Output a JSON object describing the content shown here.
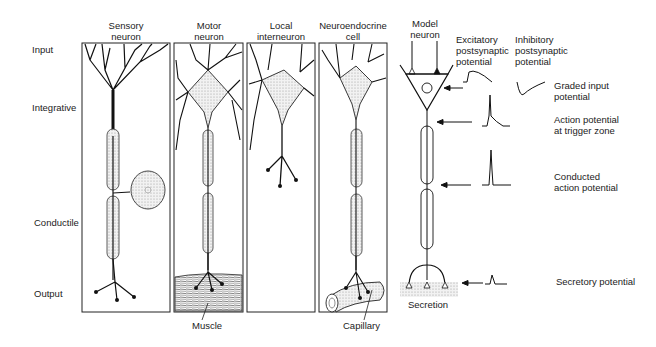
{
  "row_labels": {
    "input": "Input",
    "integrative": "Integrative",
    "conductile": "Conductile",
    "output": "Output"
  },
  "neuron_types": [
    {
      "title_line1": "Sensory",
      "title_line2": "neuron"
    },
    {
      "title_line1": "Motor",
      "title_line2": "neuron"
    },
    {
      "title_line1": "Local",
      "title_line2": "interneuron"
    },
    {
      "title_line1": "Neuroendocrine",
      "title_line2": "cell"
    }
  ],
  "bottom_labels": {
    "muscle": "Muscle",
    "capillary": "Capillary",
    "secretion": "Secretion"
  },
  "model": {
    "title_line1": "Model",
    "title_line2": "neuron",
    "excitatory_line1": "Excitatory",
    "excitatory_line2": "postsynaptic",
    "excitatory_line3": "potential",
    "inhibitory_line1": "Inhibitory",
    "inhibitory_line2": "postsynaptic",
    "inhibitory_line3": "potential"
  },
  "potentials": [
    {
      "line1": "Graded input",
      "line2": "potential"
    },
    {
      "line1": "Action potential",
      "line2": "at trigger zone"
    },
    {
      "line1": "Conducted",
      "line2": "action potential"
    },
    {
      "line1": "Secretory potential",
      "line2": ""
    }
  ]
}
